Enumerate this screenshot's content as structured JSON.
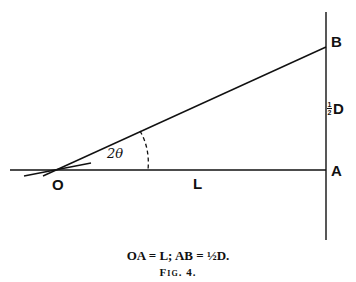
{
  "figure": {
    "labels": {
      "O": "O",
      "A": "A",
      "B": "B",
      "L": "L",
      "angle": "2θ",
      "half_num": "1",
      "half_den": "2",
      "D": "D"
    },
    "caption": {
      "equation": "OA = L; AB = ½D.",
      "figure_number": "Fig. 4."
    }
  }
}
